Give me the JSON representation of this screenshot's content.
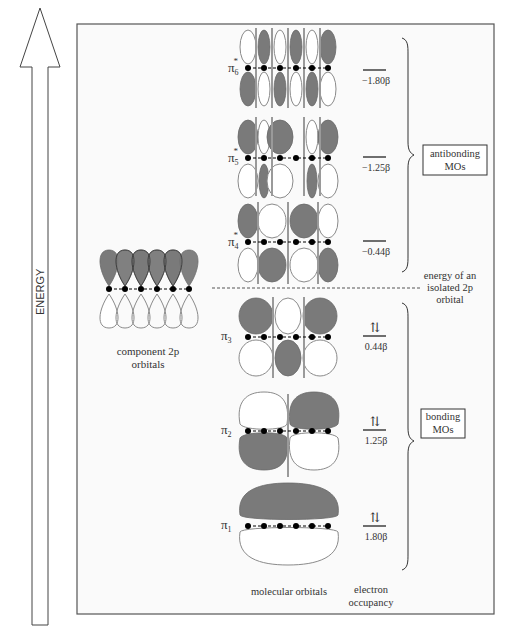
{
  "axis": {
    "label": "ENERGY"
  },
  "component": {
    "label_line1": "component 2p",
    "label_line2": "orbitals"
  },
  "levels": [
    {
      "id": "pi6",
      "symbol": "π",
      "sub": "6",
      "star": "*",
      "energy": "−1.80β",
      "occupancy": ""
    },
    {
      "id": "pi5",
      "symbol": "π",
      "sub": "5",
      "star": "*",
      "energy": "−1.25β",
      "occupancy": ""
    },
    {
      "id": "pi4",
      "symbol": "π",
      "sub": "4",
      "star": "*",
      "energy": "−0.44β",
      "occupancy": ""
    },
    {
      "id": "pi3",
      "symbol": "π",
      "sub": "3",
      "star": "",
      "energy": "0.44β",
      "occupancy": "⇅"
    },
    {
      "id": "pi2",
      "symbol": "π",
      "sub": "2",
      "star": "",
      "energy": "1.25β",
      "occupancy": "⇅"
    },
    {
      "id": "pi1",
      "symbol": "π",
      "sub": "1",
      "star": "",
      "energy": "1.80β",
      "occupancy": "⇅"
    }
  ],
  "groups": {
    "antibonding_line1": "antibonding",
    "antibonding_line2": "MOs",
    "bonding_line1": "bonding",
    "bonding_line2": "MOs"
  },
  "reference": {
    "line1": "energy of an",
    "line2": "isolated 2p",
    "line3": "orbital"
  },
  "footer": {
    "mo_label": "molecular orbitals",
    "occ_line1": "electron",
    "occ_line2": "occupancy"
  },
  "colors": {
    "shaded": "#7a7a7a",
    "outline": "#8a8a8a",
    "frame": "#555555",
    "node_line": "#999999"
  }
}
